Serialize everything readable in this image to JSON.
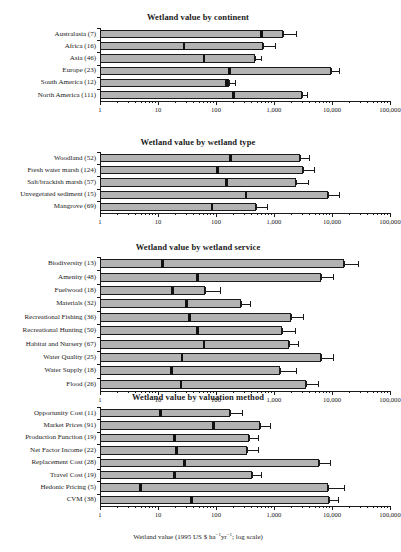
{
  "figure": {
    "xaxis_label_html": "Wetland value (1995 US $ ha<sup>&#8722;1</sup>yr<sup>&#8722;1</sup>; log scale)",
    "xaxis_label_text": "Wetland value (1995 US $ ha-1yr-1; log scale)",
    "background": "#ffffff",
    "bar_fill": "#b3b3b3",
    "bar_stroke": "#1a1a1a",
    "median_color": "#111111"
  },
  "chart_data": [
    {
      "type": "bar",
      "title": "Wetland value by continent",
      "xlabel": "Wetland value (1995 US $ ha-1yr-1; log scale)",
      "ylabel": "",
      "xscale": "log",
      "xlim": [
        1,
        100000
      ],
      "xticks": [
        1,
        10,
        100,
        1000,
        10000,
        100000
      ],
      "xticklabels": [
        "1",
        "10",
        "100",
        "1,000",
        "10,000",
        "100,000"
      ],
      "grid": false,
      "legend": null,
      "orientation": "horizontal",
      "categories": [
        "Australasia (7)",
        "Africa (16)",
        "Asia (46)",
        "Europe (23)",
        "South America (12)",
        "North America (111)"
      ],
      "values": [
        1450,
        640,
        470,
        9500,
        165,
        3000
      ],
      "medians": [
        600,
        28,
        62,
        170,
        150,
        200
      ],
      "error_upper": [
        2500,
        1100,
        620,
        14000,
        220,
        3800
      ]
    },
    {
      "type": "bar",
      "title": "Wetland value by wetland type",
      "xlabel": "Wetland value (1995 US $ ha-1yr-1; log scale)",
      "ylabel": "",
      "xscale": "log",
      "xlim": [
        1,
        100000
      ],
      "xticks": [
        1,
        10,
        100,
        1000,
        10000,
        100000
      ],
      "xticklabels": [
        "1",
        "10",
        "100",
        "1,000",
        "10,000",
        "100,000"
      ],
      "grid": false,
      "legend": null,
      "orientation": "horizontal",
      "categories": [
        "Woodland (52)",
        "Fresh water marsh (124)",
        "Salt/brackish marsh (57)",
        "Unvegetated sediment (15)",
        "Mangrove (69)"
      ],
      "values": [
        2800,
        3200,
        2400,
        8500,
        490
      ],
      "medians": [
        180,
        105,
        150,
        330,
        85
      ],
      "error_upper": [
        4200,
        5000,
        4000,
        14000,
        800
      ]
    },
    {
      "type": "bar",
      "title": "Wetland value by wetland service",
      "xlabel": "Wetland value (1995 US $ ha-1yr-1; log scale)",
      "ylabel": "",
      "xscale": "log",
      "xlim": [
        1,
        100000
      ],
      "xticks": [
        1,
        10,
        100,
        1000,
        10000,
        100000
      ],
      "xticklabels": [
        "1",
        "10",
        "100",
        "1,000",
        "10,000",
        "100,000"
      ],
      "grid": false,
      "legend": null,
      "orientation": "horizontal",
      "categories": [
        "Biodiversity (13)",
        "Amenity (48)",
        "Fuelwood (18)",
        "Materials (32)",
        "Recreational Fishing (36)",
        "Recreational Hunting (50)",
        "Habitat and Nursery (67)",
        "Water Quality (25)",
        "Water Supply (18)",
        "Flood (26)"
      ],
      "values": [
        16000,
        6500,
        65,
        270,
        2000,
        1350,
        1800,
        6500,
        1250,
        3600
      ],
      "medians": [
        12,
        48,
        18,
        31,
        35,
        48,
        62,
        26,
        17,
        25
      ],
      "error_upper": [
        29000,
        11000,
        120,
        400,
        3300,
        2400,
        2700,
        11000,
        2500,
        6000
      ]
    },
    {
      "type": "bar",
      "title": "Wetland value by valuation method",
      "xlabel": "Wetland value (1995 US $ ha-1yr-1; log scale)",
      "ylabel": "",
      "xscale": "log",
      "xlim": [
        1,
        100000
      ],
      "xticks": [
        1,
        10,
        100,
        1000,
        10000,
        100000
      ],
      "xticklabels": [
        "1",
        "10",
        "100",
        "1,000",
        "10,000",
        "100,000"
      ],
      "grid": false,
      "legend": null,
      "orientation": "horizontal",
      "categories": [
        "Opportunity Cost (11)",
        "Market Prices (91)",
        "Production Function (19)",
        "Net Factor Income (22)",
        "Replacement Cost (28)",
        "Travel Cost (19)",
        "Hedonic Pricing (5)",
        "CVM (38)"
      ],
      "values": [
        175,
        580,
        370,
        340,
        6000,
        420,
        8500,
        8800
      ],
      "medians": [
        11,
        90,
        19,
        21,
        29,
        19,
        5,
        38
      ],
      "error_upper": [
        290,
        880,
        560,
        560,
        9500,
        620,
        17000,
        13000
      ]
    }
  ]
}
